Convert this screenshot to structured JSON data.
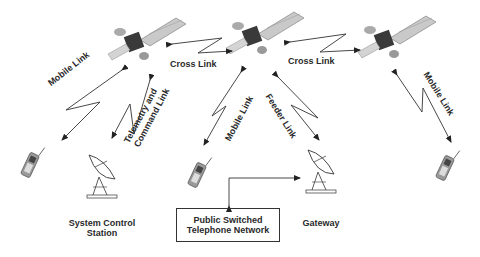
{
  "diagram": {
    "nodes": {
      "satellites": [
        "Satellite 1",
        "Satellite 2",
        "Satellite 3"
      ],
      "system_control_station": "System Control Station",
      "system_control_station_lines": [
        "System Control",
        "Station"
      ],
      "gateway": "Gateway",
      "pstn_lines": [
        "Public Switched",
        "Telephone Network"
      ],
      "mobile_phones": [
        "Mobile phone 1",
        "Mobile phone 2",
        "Mobile phone 3"
      ]
    },
    "links": {
      "cross_link_1": "Cross Link",
      "cross_link_2": "Cross Link",
      "mobile_link_1": "Mobile Link",
      "mobile_link_2": "Mobile Link",
      "mobile_link_3": "Mobile Link",
      "telemetry_line1": "Telemetry and",
      "telemetry_line2": "Command Link",
      "feeder_link": "Feeder Link"
    },
    "colors": {
      "line": "#333333",
      "panel": "#bdbdbd",
      "body": "#3a3a3a"
    }
  }
}
